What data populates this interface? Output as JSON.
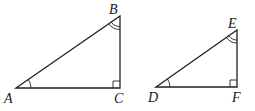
{
  "diagram": {
    "stroke_color": "#222222",
    "triangles": [
      {
        "vertices": [
          {
            "label": "A",
            "x": 16,
            "y": 88
          },
          {
            "label": "B",
            "x": 120,
            "y": 16
          },
          {
            "label": "C",
            "x": 120,
            "y": 88
          }
        ],
        "single_arc_angle": "A",
        "double_arc_angle": "B",
        "right_angle": "C"
      },
      {
        "vertices": [
          {
            "label": "D",
            "x": 156,
            "y": 87
          },
          {
            "label": "E",
            "x": 237,
            "y": 30
          },
          {
            "label": "F",
            "x": 237,
            "y": 87
          }
        ],
        "single_arc_angle": "D",
        "double_arc_angle": "E",
        "right_angle": "F"
      }
    ]
  }
}
